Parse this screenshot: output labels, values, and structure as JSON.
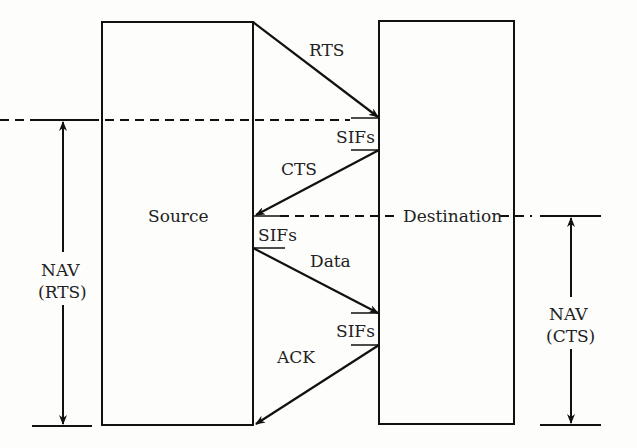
{
  "diagram": {
    "nodes": {
      "source": "Source",
      "destination": "Destination"
    },
    "messages": {
      "rts": "RTS",
      "cts": "CTS",
      "data": "Data",
      "ack": "ACK"
    },
    "sifs": [
      "SIFs",
      "SIFs",
      "SIFs"
    ],
    "nav_rts": {
      "line1": "NAV",
      "line2": "(RTS)"
    },
    "nav_cts": {
      "line1": "NAV",
      "line2": "(CTS)"
    },
    "colors": {
      "stroke": "#111111",
      "text": "#222222",
      "background": "#fdfdfb"
    }
  }
}
